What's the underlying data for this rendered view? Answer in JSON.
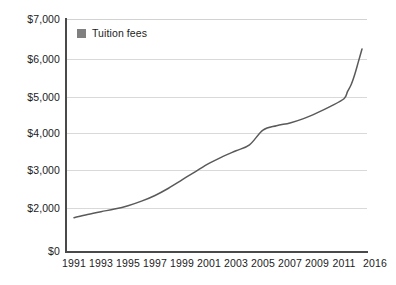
{
  "chart_data": {
    "type": "line",
    "title": "",
    "subtitle": "",
    "xlabel": "",
    "ylabel": "",
    "legend": {
      "position": "top-left-inside",
      "entries": [
        {
          "name": "Tuition fees",
          "color": "#808080",
          "marker": "square"
        }
      ]
    },
    "grid": {
      "horizontal": true,
      "vertical": false,
      "color": "#d9d9d9"
    },
    "axis": {
      "y_broken": true,
      "y_break_note": "axis compressed between $0 and $2,000",
      "y_ticks": [
        "$0",
        "$2,000",
        "$3,000",
        "$4,000",
        "$5,000",
        "$6,000",
        "$7,000"
      ],
      "y_tick_values": [
        0,
        2000,
        3000,
        4000,
        5000,
        6000,
        7000
      ],
      "ylim": [
        0,
        7000
      ],
      "x_ticks": [
        "1991",
        "1993",
        "1995",
        "1997",
        "1999",
        "2001",
        "2003",
        "2005",
        "2007",
        "2009",
        "2011",
        "2016"
      ],
      "x_tick_values": [
        1991,
        1993,
        1995,
        1997,
        1999,
        2001,
        2003,
        2005,
        2007,
        2009,
        2011,
        2016
      ],
      "xlim": [
        1991,
        2016
      ],
      "axis_color": "#4a4a4a"
    },
    "categories": [
      1991,
      1992,
      1993,
      1994,
      1995,
      1996,
      1997,
      1998,
      1999,
      2000,
      2001,
      2002,
      2003,
      2004,
      2005,
      2006,
      2007,
      2008,
      2009,
      2010,
      2011,
      2012,
      2013,
      2014,
      2015,
      2016
    ],
    "series": [
      {
        "name": "Tuition fees",
        "color": "#5a5a5a",
        "values": [
          1550,
          1700,
          1830,
          1950,
          2060,
          2180,
          2330,
          2520,
          2740,
          2960,
          3180,
          3360,
          3520,
          3680,
          4080,
          4200,
          4280,
          4400,
          4560,
          4740,
          4950,
          5150,
          5330,
          5600,
          5930,
          6250
        ]
      }
    ]
  },
  "legend": {
    "label": "Tuition fees"
  }
}
